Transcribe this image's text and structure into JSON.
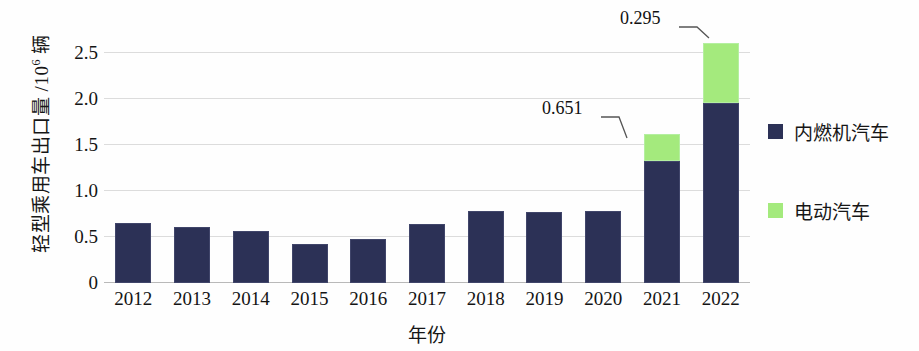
{
  "chart_data": {
    "type": "bar",
    "stacked": true,
    "title": "",
    "xlabel": "年份",
    "ylabel": "轻型乘用车出口量 /10⁶ 辆",
    "ylabel_base": "轻型乘用车出口量 /10",
    "ylabel_exponent": "6",
    "ylabel_unit": " 辆",
    "categories": [
      "2012",
      "2013",
      "2014",
      "2015",
      "2016",
      "2017",
      "2018",
      "2019",
      "2020",
      "2021",
      "2022"
    ],
    "series": [
      {
        "name": "内燃机汽车",
        "color": "#2c3156",
        "values": [
          0.65,
          0.61,
          0.57,
          0.42,
          0.48,
          0.64,
          0.78,
          0.77,
          0.78,
          1.33,
          1.96
        ]
      },
      {
        "name": "电动汽车",
        "color": "#a4ea7d",
        "values": [
          0,
          0,
          0,
          0,
          0,
          0,
          0,
          0,
          0,
          0.295,
          0.651
        ]
      }
    ],
    "totals": [
      0.65,
      0.61,
      0.57,
      0.42,
      0.48,
      0.64,
      0.78,
      0.77,
      0.78,
      1.625,
      2.611
    ],
    "ylim": [
      0,
      2.75
    ],
    "yticks": [
      "0",
      "0.5",
      "1.0",
      "1.5",
      "2.0",
      "2.5"
    ],
    "ytick_values": [
      0,
      0.5,
      1.0,
      1.5,
      2.0,
      2.5
    ],
    "grid": true,
    "legend_position": "right",
    "annotations": [
      {
        "text": "0.295",
        "category": "2021",
        "series": "电动汽车",
        "value": 0.295
      },
      {
        "text": "0.651",
        "category": "2022",
        "series": "电动汽车",
        "value": 0.651
      }
    ]
  },
  "legend": {
    "items": [
      {
        "label": "内燃机汽车",
        "color": "#2c3156"
      },
      {
        "label": "电动汽车",
        "color": "#a4ea7d"
      }
    ]
  }
}
